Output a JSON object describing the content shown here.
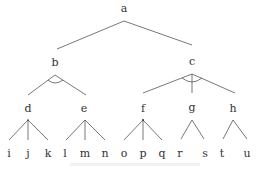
{
  "diagram": {
    "type": "and-or tree",
    "line_color": "#555555",
    "nodes": {
      "a": {
        "label": "a",
        "x": 124,
        "y": 8
      },
      "b": {
        "label": "b",
        "x": 55,
        "y": 62
      },
      "c": {
        "label": "c",
        "x": 192,
        "y": 61
      },
      "d": {
        "label": "d",
        "x": 28,
        "y": 108
      },
      "e": {
        "label": "e",
        "x": 84,
        "y": 108
      },
      "f": {
        "label": "f",
        "x": 143,
        "y": 108
      },
      "g": {
        "label": "g",
        "x": 192,
        "y": 107
      },
      "h": {
        "label": "h",
        "x": 233,
        "y": 108
      },
      "i": {
        "label": "i",
        "x": 9,
        "y": 153
      },
      "j": {
        "label": "j",
        "x": 28,
        "y": 153
      },
      "k": {
        "label": "k",
        "x": 48,
        "y": 153
      },
      "l": {
        "label": "l",
        "x": 65,
        "y": 153
      },
      "m": {
        "label": "m",
        "x": 85,
        "y": 153
      },
      "n": {
        "label": "n",
        "x": 105,
        "y": 153
      },
      "o": {
        "label": "o",
        "x": 124,
        "y": 153
      },
      "p": {
        "label": "p",
        "x": 143,
        "y": 153
      },
      "q": {
        "label": "q",
        "x": 162,
        "y": 153
      },
      "r": {
        "label": "r",
        "x": 180,
        "y": 153
      },
      "s": {
        "label": "s",
        "x": 205,
        "y": 153
      },
      "t": {
        "label": "t",
        "x": 222,
        "y": 153
      },
      "u": {
        "label": "u",
        "x": 247,
        "y": 153
      }
    },
    "edges": [
      [
        "a",
        "b"
      ],
      [
        "a",
        "c"
      ],
      [
        "b",
        "d"
      ],
      [
        "b",
        "e"
      ],
      [
        "c",
        "f"
      ],
      [
        "c",
        "g"
      ],
      [
        "c",
        "h"
      ],
      [
        "d",
        "i"
      ],
      [
        "d",
        "j"
      ],
      [
        "d",
        "k"
      ],
      [
        "e",
        "l"
      ],
      [
        "e",
        "m"
      ],
      [
        "e",
        "n"
      ],
      [
        "f",
        "o"
      ],
      [
        "f",
        "p"
      ],
      [
        "f",
        "q"
      ],
      [
        "g",
        "r"
      ],
      [
        "g",
        "s"
      ],
      [
        "h",
        "t"
      ],
      [
        "h",
        "u"
      ]
    ],
    "and_arcs": [
      "b",
      "c"
    ],
    "caption": ""
  }
}
